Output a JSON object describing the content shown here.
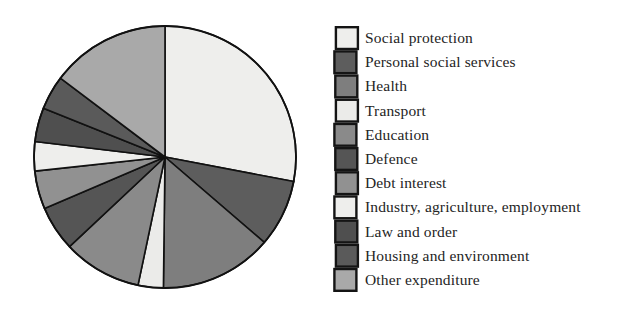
{
  "chart_data": {
    "type": "pie",
    "title": "",
    "subtitle": "",
    "xlabel": "",
    "ylabel": "",
    "grid": false,
    "legend_position": "right",
    "start_angle_deg": 0,
    "direction": "clockwise",
    "center": {
      "x": 143,
      "y": 145
    },
    "radius": 131,
    "labels": [
      "Social protection",
      "Personal social services",
      "Health",
      "Transport",
      "Education",
      "Defence",
      "Debt interest",
      "Industry, agriculture, employment",
      "Law and order",
      "Housing and environment",
      "Other expenditure"
    ],
    "values": [
      28.0,
      8.3,
      13.9,
      3.1,
      9.7,
      5.6,
      4.7,
      3.6,
      4.2,
      4.2,
      14.7
    ],
    "units": "percent",
    "slices": [
      {
        "label": "Social protection",
        "value": 28.0,
        "start_deg": 0.0,
        "end_deg": 100.8,
        "color": "#eeeeec"
      },
      {
        "label": "Personal social services",
        "value": 8.3,
        "start_deg": 100.8,
        "end_deg": 130.7,
        "color": "#5d5d5d"
      },
      {
        "label": "Health",
        "value": 13.9,
        "start_deg": 130.7,
        "end_deg": 180.7,
        "color": "#7e7e7e"
      },
      {
        "label": "Transport",
        "value": 3.1,
        "start_deg": 180.7,
        "end_deg": 191.9,
        "color": "#ebebe9"
      },
      {
        "label": "Education",
        "value": 9.7,
        "start_deg": 191.9,
        "end_deg": 226.8,
        "color": "#8a8a8a"
      },
      {
        "label": "Defence",
        "value": 5.6,
        "start_deg": 226.8,
        "end_deg": 246.9,
        "color": "#555555"
      },
      {
        "label": "Debt interest",
        "value": 4.7,
        "start_deg": 246.9,
        "end_deg": 263.8,
        "color": "#919191"
      },
      {
        "label": "Industry, agriculture, employment",
        "value": 3.6,
        "start_deg": 263.8,
        "end_deg": 276.8,
        "color": "#eeeeec"
      },
      {
        "label": "Law and order",
        "value": 4.2,
        "start_deg": 276.8,
        "end_deg": 291.9,
        "color": "#4f4f4f"
      },
      {
        "label": "Housing and environment",
        "value": 4.2,
        "start_deg": 291.9,
        "end_deg": 307.0,
        "color": "#5a5a5a"
      },
      {
        "label": "Other expenditure",
        "value": 14.7,
        "start_deg": 307.0,
        "end_deg": 360.0,
        "color": "#a9a9a9"
      }
    ],
    "stroke_color": "#111111",
    "stroke_width": 1.6
  },
  "legend": {
    "items": [
      {
        "label": "Social protection",
        "color": "#eeeeec"
      },
      {
        "label": "Personal social services",
        "color": "#5d5d5d"
      },
      {
        "label": "Health",
        "color": "#7e7e7e"
      },
      {
        "label": "Transport",
        "color": "#ebebe9"
      },
      {
        "label": "Education",
        "color": "#8a8a8a"
      },
      {
        "label": "Defence",
        "color": "#555555"
      },
      {
        "label": "Debt interest",
        "color": "#919191"
      },
      {
        "label": "Industry, agriculture, employment",
        "color": "#eeeeec"
      },
      {
        "label": "Law and order",
        "color": "#4f4f4f"
      },
      {
        "label": "Housing and environment",
        "color": "#5a5a5a"
      },
      {
        "label": "Other expenditure",
        "color": "#a9a9a9"
      }
    ]
  }
}
